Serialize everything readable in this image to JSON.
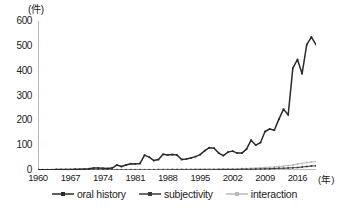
{
  "chart_data": {
    "type": "line",
    "title": "",
    "xlabel": "(年)",
    "ylabel": "(件)",
    "xlim": [
      1960,
      2020
    ],
    "ylim": [
      0,
      600
    ],
    "ytick_labels": [
      "600",
      "500",
      "400",
      "300",
      "200",
      "100",
      "0"
    ],
    "ytick_values": [
      600,
      500,
      400,
      300,
      200,
      100,
      0
    ],
    "xtick_labels": [
      "1960",
      "1967",
      "1974",
      "1981",
      "1988",
      "1995",
      "2002",
      "2009",
      "2016"
    ],
    "xtick_values": [
      1960,
      1967,
      1974,
      1981,
      1988,
      1995,
      2002,
      2009,
      2016
    ],
    "grid": false,
    "legend_position": "bottom",
    "x": [
      1960,
      1961,
      1962,
      1963,
      1964,
      1965,
      1966,
      1967,
      1968,
      1969,
      1970,
      1971,
      1972,
      1973,
      1974,
      1975,
      1976,
      1977,
      1978,
      1979,
      1980,
      1981,
      1982,
      1983,
      1984,
      1985,
      1986,
      1987,
      1988,
      1989,
      1990,
      1991,
      1992,
      1993,
      1994,
      1995,
      1996,
      1997,
      1998,
      1999,
      2000,
      2001,
      2002,
      2003,
      2004,
      2005,
      2006,
      2007,
      2008,
      2009,
      2010,
      2011,
      2012,
      2013,
      2014,
      2015,
      2016,
      2017,
      2018,
      2019,
      2020
    ],
    "series": [
      {
        "name": "oral history",
        "color": "#2b2b2b",
        "marker": "square",
        "values": [
          1,
          1,
          1,
          1,
          2,
          2,
          2,
          2,
          3,
          3,
          4,
          5,
          8,
          8,
          7,
          6,
          8,
          20,
          14,
          20,
          25,
          24,
          26,
          60,
          52,
          38,
          42,
          63,
          60,
          62,
          60,
          42,
          44,
          48,
          54,
          62,
          78,
          90,
          88,
          68,
          58,
          72,
          76,
          68,
          68,
          84,
          120,
          100,
          110,
          155,
          165,
          160,
          205,
          245,
          222,
          410,
          445,
          388,
          505,
          535,
          505
        ]
      },
      {
        "name": "subjectivity",
        "color": "#3a3a3a",
        "marker": "square",
        "values": [
          0,
          0,
          0,
          0,
          0,
          0,
          0,
          0,
          0,
          0,
          0,
          0,
          0,
          0,
          0,
          0,
          0,
          0,
          0,
          0,
          0,
          0,
          0,
          0,
          0,
          0,
          0,
          0,
          0,
          1,
          1,
          1,
          1,
          1,
          1,
          1,
          1,
          1,
          1,
          2,
          2,
          2,
          2,
          2,
          3,
          3,
          3,
          4,
          4,
          5,
          5,
          6,
          7,
          7,
          8,
          9,
          10,
          12,
          14,
          16,
          17
        ]
      },
      {
        "name": "interaction",
        "color": "#b9b9b9",
        "marker": "square",
        "values": [
          1,
          1,
          1,
          1,
          1,
          1,
          1,
          1,
          1,
          1,
          1,
          1,
          2,
          2,
          2,
          2,
          2,
          2,
          2,
          2,
          2,
          2,
          2,
          2,
          2,
          2,
          3,
          3,
          3,
          3,
          3,
          3,
          3,
          3,
          4,
          4,
          4,
          4,
          4,
          4,
          5,
          5,
          5,
          5,
          6,
          6,
          7,
          8,
          9,
          10,
          11,
          12,
          14,
          16,
          18,
          20,
          24,
          26,
          30,
          32,
          34
        ]
      }
    ]
  },
  "legend": {
    "items": [
      {
        "label": "oral history",
        "color": "#2b2b2b"
      },
      {
        "label": "subjectivity",
        "color": "#3a3a3a"
      },
      {
        "label": "interaction",
        "color": "#b9b9b9"
      }
    ]
  }
}
